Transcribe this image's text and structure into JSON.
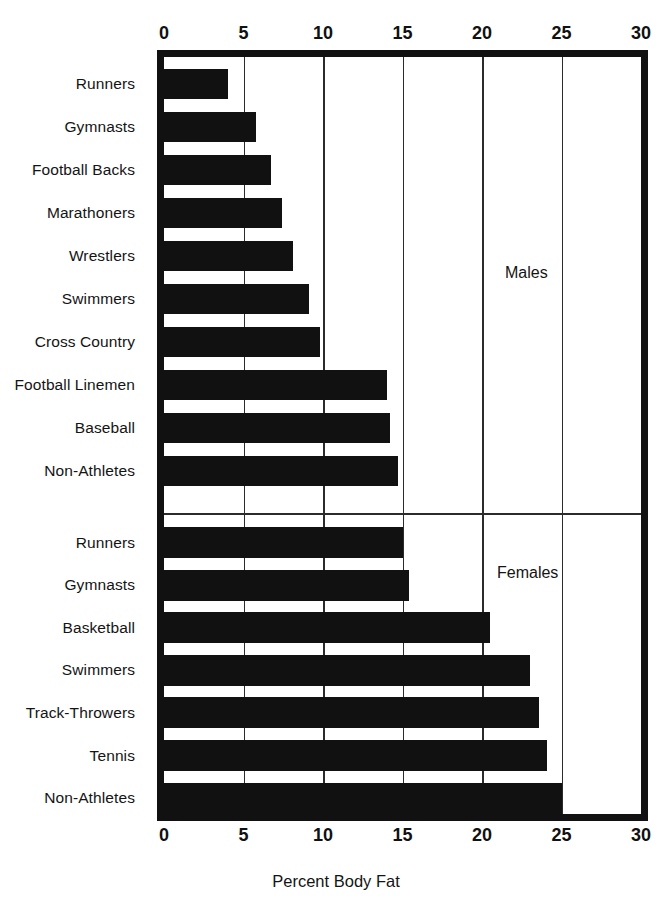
{
  "chart_data": {
    "type": "bar",
    "orientation": "horizontal",
    "title": "",
    "xlabel": "Percent Body Fat",
    "ylabel": "",
    "xlim": [
      0,
      30
    ],
    "xticks": [
      0,
      5,
      10,
      15,
      20,
      25,
      30
    ],
    "xtick_labels": [
      "0",
      "5",
      "10",
      "15",
      "20",
      "25",
      "30"
    ],
    "grid": true,
    "grid_axis": "x",
    "bar_color": "#111111",
    "axis_color": "#111111",
    "groups": [
      {
        "name": "Males",
        "annotation": "Males",
        "categories": [
          "Runners",
          "Gymnasts",
          "Football Backs",
          "Marathoners",
          "Wrestlers",
          "Swimmers",
          "Cross Country",
          "Football Linemen",
          "Baseball",
          "Non-Athletes"
        ],
        "values": [
          4.0,
          5.8,
          6.7,
          7.4,
          8.1,
          9.1,
          9.8,
          14.0,
          14.2,
          14.7
        ]
      },
      {
        "name": "Females",
        "annotation": "Females",
        "categories": [
          "Runners",
          "Gymnasts",
          "Basketball",
          "Swimmers",
          "Track-Throwers",
          "Tennis",
          "Non-Athletes"
        ],
        "values": [
          15.0,
          15.4,
          20.5,
          23.0,
          23.6,
          24.1,
          25.0
        ]
      }
    ]
  },
  "axis": {
    "top_ticks": [
      "0",
      "5",
      "10",
      "15",
      "20",
      "25",
      "30"
    ],
    "bottom_ticks": [
      "0",
      "5",
      "10",
      "15",
      "20",
      "25",
      "30"
    ],
    "x_axis_title": "Percent Body Fat"
  },
  "annotations": {
    "males": "Males",
    "females": "Females"
  },
  "clipped_header": ""
}
